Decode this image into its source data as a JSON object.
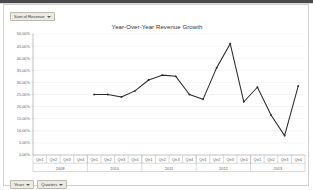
{
  "window": {
    "app": "excel-pivotchart"
  },
  "legend_field_button": {
    "label": "Sum of Revenue",
    "caret": "chevron-down-icon"
  },
  "axis_field_buttons": [
    {
      "label": "Years",
      "caret": "chevron-down-icon"
    },
    {
      "label": "Quarters",
      "caret": "chevron-down-icon"
    }
  ],
  "chart_data": {
    "type": "line",
    "title": "Year-Over-Year Revenue Growth",
    "xlabel": "",
    "ylabel": "",
    "grid": true,
    "legend": "none",
    "ylim": [
      0,
      50
    ],
    "ytick_step": 5,
    "ytick_labels": [
      "50.00%",
      "45.00%",
      "40.00%",
      "35.00%",
      "30.00%",
      "25.00%",
      "20.00%",
      "15.00%",
      "10.00%",
      "5.00%",
      "0.00%"
    ],
    "ytick_values": [
      50,
      45,
      40,
      35,
      30,
      25,
      20,
      15,
      10,
      5,
      0
    ],
    "x_group_label": "Years",
    "x_tick_label": "Quarters",
    "x_groups": [
      {
        "label": "2009",
        "ticks": [
          "Qtr1",
          "Qtr2",
          "Qtr3",
          "Qtr4"
        ]
      },
      {
        "label": "2010",
        "ticks": [
          "Qtr1",
          "Qtr2",
          "Qtr3",
          "Qtr4"
        ]
      },
      {
        "label": "2011",
        "ticks": [
          "Qtr1",
          "Qtr2",
          "Qtr3",
          "Qtr4"
        ]
      },
      {
        "label": "2012",
        "ticks": [
          "Qtr1",
          "Qtr2",
          "Qtr3",
          "Qtr4"
        ]
      },
      {
        "label": "2013",
        "ticks": [
          "Qtr1",
          "Qtr2",
          "Qtr3",
          "Qtr4"
        ]
      }
    ],
    "categories": [
      "2009 Qtr1",
      "2009 Qtr2",
      "2009 Qtr3",
      "2009 Qtr4",
      "2010 Qtr1",
      "2010 Qtr2",
      "2010 Qtr3",
      "2010 Qtr4",
      "2011 Qtr1",
      "2011 Qtr2",
      "2011 Qtr3",
      "2011 Qtr4",
      "2012 Qtr1",
      "2012 Qtr2",
      "2012 Qtr3",
      "2012 Qtr4",
      "2013 Qtr1",
      "2013 Qtr2",
      "2013 Qtr3",
      "2013 Qtr4"
    ],
    "series": [
      {
        "name": "Sum of Revenue",
        "color": "#2b2b2b",
        "values": [
          null,
          null,
          null,
          null,
          25.0,
          25.0,
          24.0,
          26.5,
          31.0,
          33.0,
          32.5,
          25.0,
          23.0,
          36.0,
          46.0,
          22.0,
          28.0,
          16.5,
          8.0,
          28.5
        ]
      }
    ],
    "annotations": []
  }
}
